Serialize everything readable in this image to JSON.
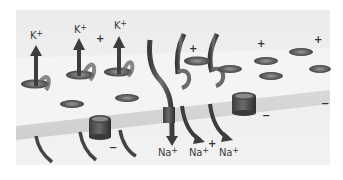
{
  "figure": {
    "colors": {
      "background": "#ffffff",
      "panel": "#e9e9e9",
      "membrane_top": "#ededed",
      "membrane_edge": "#d4d4d4",
      "channel": "#5a5a5a",
      "arrow": "#444444"
    }
  },
  "labels": {
    "k_ions": [
      {
        "ion": "K",
        "charge": "+"
      },
      {
        "ion": "K",
        "charge": "+"
      },
      {
        "ion": "K",
        "charge": "+"
      }
    ],
    "na_ions": [
      {
        "ion": "Na",
        "charge": "+"
      },
      {
        "ion": "Na",
        "charge": "+"
      },
      {
        "ion": "Na",
        "charge": "+"
      }
    ],
    "plus_signs": [
      "+",
      "+",
      "+",
      "+",
      "+"
    ],
    "minus_signs": [
      "−",
      "−",
      "−",
      "−"
    ]
  }
}
